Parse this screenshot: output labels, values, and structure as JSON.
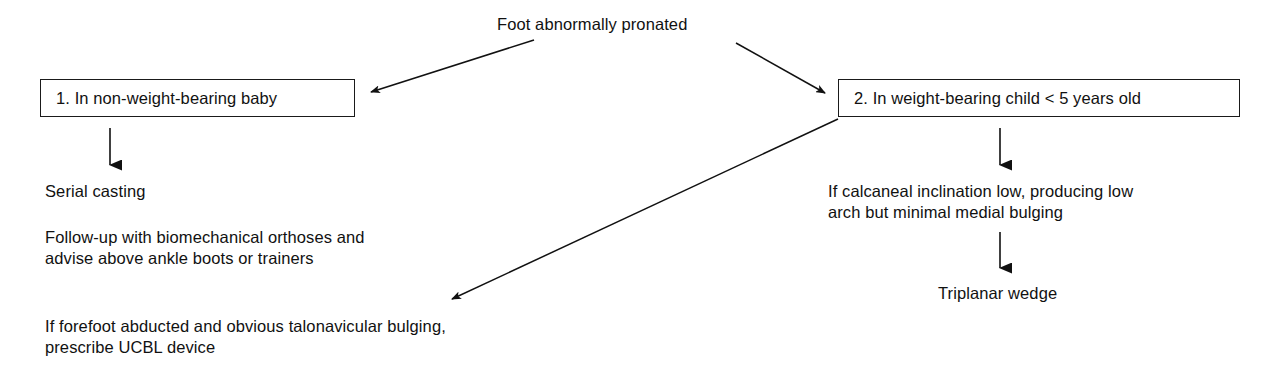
{
  "diagram": {
    "title_node": {
      "label": "Foot abnormally pronated"
    },
    "branches": [
      {
        "id": "branch-1",
        "box_label": "1. In non-weight-bearing baby",
        "steps": [
          "Serial casting",
          "Follow-up with biomechanical orthoses and\nadvise above ankle boots or trainers",
          "If forefoot abducted and obvious talonavicular bulging,\nprescribe UCBL device"
        ]
      },
      {
        "id": "branch-2",
        "box_label": "2. In weight-bearing child < 5 years old",
        "steps": [
          "If calcaneal inclination low, producing low\narch but minimal medial bulging",
          "Triplanar wedge"
        ]
      }
    ],
    "text_blocks": {
      "serial_casting": "Serial casting",
      "follow_up_line1": "Follow-up with biomechanical orthoses and",
      "follow_up_line2": "advise above ankle boots or trainers",
      "forefoot_line1": "If forefoot abducted and obvious talonavicular bulging,",
      "forefoot_line2": "prescribe UCBL device",
      "calcaneal_line1": "If calcaneal inclination low, producing low",
      "calcaneal_line2": "arch but minimal medial bulging",
      "triplanar_wedge": "Triplanar wedge"
    },
    "colors": {
      "ink": "#111111",
      "stroke": "#1a1a1a",
      "background": "#ffffff"
    }
  }
}
